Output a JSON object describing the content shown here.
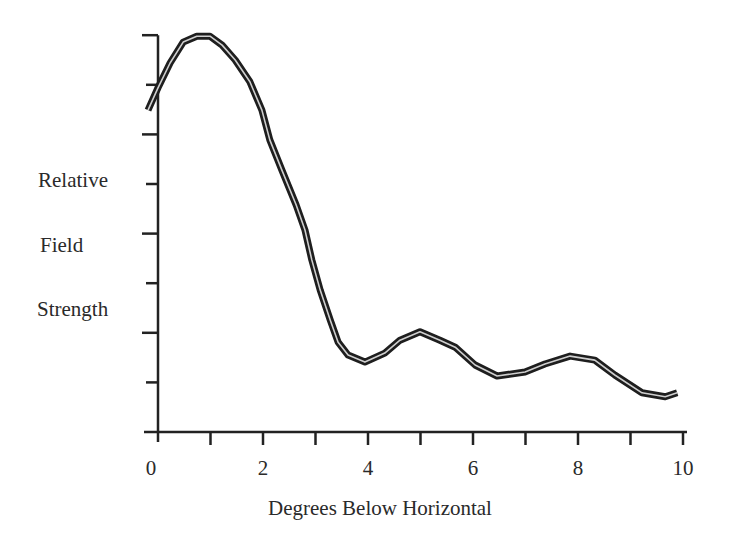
{
  "chart_data": {
    "type": "line",
    "title": "",
    "xlabel": "Degrees Below Horizontal",
    "ylabel": "Relative Field Strength",
    "ylabel_lines": [
      "Relative",
      "Field",
      "Strength"
    ],
    "xlim": [
      0,
      10
    ],
    "ylim": [
      0,
      8
    ],
    "x_ticks": [
      0,
      1,
      2,
      3,
      4,
      5,
      6,
      7,
      8,
      9,
      10
    ],
    "x_tick_labels": [
      {
        "value": 0,
        "label": "0"
      },
      {
        "value": 2,
        "label": "2"
      },
      {
        "value": 4,
        "label": "4"
      },
      {
        "value": 6,
        "label": "6"
      },
      {
        "value": 8,
        "label": "8"
      },
      {
        "value": 10,
        "label": "10"
      }
    ],
    "y_ticks": [
      1,
      2,
      3,
      4,
      5,
      6,
      7,
      8
    ],
    "y_tick_labels": [],
    "grid": false,
    "legend": null,
    "line_style": "double line (dark outline with light center)",
    "series": [
      {
        "name": "Relative Field Strength",
        "x": [
          -0.19,
          0.0,
          0.23,
          0.48,
          0.74,
          0.99,
          1.22,
          1.47,
          1.75,
          1.98,
          2.13,
          2.36,
          2.63,
          2.8,
          2.93,
          3.09,
          3.28,
          3.43,
          3.62,
          3.94,
          4.32,
          4.61,
          4.99,
          5.37,
          5.66,
          6.04,
          6.46,
          6.99,
          7.37,
          7.85,
          8.32,
          8.7,
          9.22,
          9.66,
          9.89
        ],
        "y": [
          6.49,
          6.94,
          7.44,
          7.86,
          7.98,
          7.98,
          7.8,
          7.5,
          7.06,
          6.49,
          5.89,
          5.28,
          4.58,
          4.07,
          3.47,
          2.86,
          2.26,
          1.81,
          1.55,
          1.41,
          1.59,
          1.85,
          2.02,
          1.85,
          1.71,
          1.35,
          1.13,
          1.21,
          1.37,
          1.53,
          1.45,
          1.15,
          0.79,
          0.71,
          0.79
        ]
      }
    ]
  }
}
